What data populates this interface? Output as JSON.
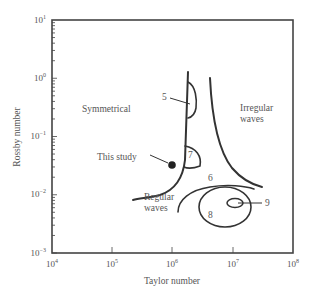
{
  "figure": {
    "x_axis": {
      "label": "Taylor number",
      "ticks": [
        {
          "base": "10",
          "exp": "4"
        },
        {
          "base": "10",
          "exp": "5"
        },
        {
          "base": "10",
          "exp": "6"
        },
        {
          "base": "10",
          "exp": "7"
        },
        {
          "base": "10",
          "exp": "8"
        }
      ]
    },
    "y_axis": {
      "label": "Rossby number",
      "ticks": [
        {
          "base": "10",
          "exp": "1"
        },
        {
          "base": "10",
          "exp": "0"
        },
        {
          "base": "10",
          "exp": "−1"
        },
        {
          "base": "10",
          "exp": "−2"
        },
        {
          "base": "10",
          "exp": "−3"
        }
      ]
    },
    "regions": {
      "symmetrical": "Symmetrical",
      "irregular_line1": "Irregular",
      "irregular_line2": "waves",
      "regular_line1": "Regular",
      "regular_line2": "waves"
    },
    "annotations": {
      "this_study": "This study",
      "label_5": "5",
      "label_6": "6",
      "label_7": "7",
      "label_8": "8",
      "label_9": "9"
    },
    "colors": {
      "line": "#333333",
      "text": "#555555",
      "frame": "#444444"
    }
  }
}
